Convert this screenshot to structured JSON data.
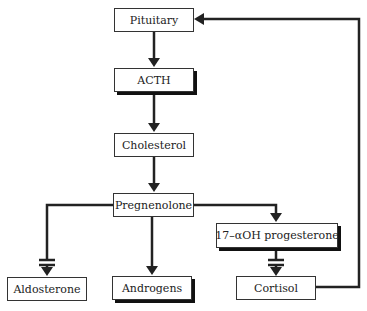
{
  "diagram": {
    "type": "flowchart",
    "nodes": {
      "pituitary": {
        "label": "Pituitary"
      },
      "acth": {
        "label": "ACTH"
      },
      "cholesterol": {
        "label": "Cholesterol"
      },
      "pregnenolone": {
        "label": "Pregnenolone"
      },
      "oh_progesterone": {
        "label": "17–αOH progesterone"
      },
      "aldosterone": {
        "label": "Aldosterone"
      },
      "androgens": {
        "label": "Androgens"
      },
      "cortisol": {
        "label": "Cortisol"
      }
    },
    "edges": [
      {
        "from": "Pituitary",
        "to": "ACTH",
        "type": "arrow"
      },
      {
        "from": "ACTH",
        "to": "Cholesterol",
        "type": "arrow"
      },
      {
        "from": "Cholesterol",
        "to": "Pregnenolone",
        "type": "arrow"
      },
      {
        "from": "Pregnenolone",
        "to": "Aldosterone",
        "type": "blocked-arrow"
      },
      {
        "from": "Pregnenolone",
        "to": "Androgens",
        "type": "arrow"
      },
      {
        "from": "Pregnenolone",
        "to": "17–αOH progesterone",
        "type": "arrow"
      },
      {
        "from": "17–αOH progesterone",
        "to": "Cortisol",
        "type": "blocked-arrow"
      },
      {
        "from": "Cortisol",
        "to": "Pituitary",
        "type": "feedback-arrow"
      }
    ],
    "colors": {
      "line": "#222222",
      "box_border": "#333333",
      "background": "#ffffff"
    }
  }
}
